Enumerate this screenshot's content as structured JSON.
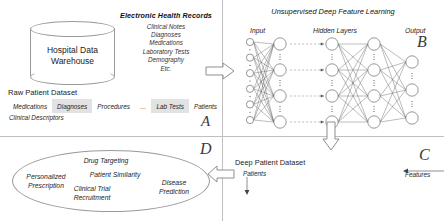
{
  "quadrants": {
    "a": "A",
    "b": "B",
    "c": "C",
    "d": "D"
  },
  "warehouse": {
    "label_line1": "Hospital Data",
    "label_line2": "Warehouse"
  },
  "ehr": {
    "title": "Electronic Health Records",
    "items": [
      "Clinical Notes",
      "Diagnoses",
      "Medications",
      "Laboratory Tests",
      "Demography",
      "Etc."
    ]
  },
  "raw_dataset": {
    "title": "Raw Patient Dataset",
    "columns": [
      {
        "label": "Medications",
        "shaded": false
      },
      {
        "label": "Diagnoses",
        "shaded": true
      },
      {
        "label": "Procedures",
        "shaded": false
      },
      {
        "label": "…",
        "shaded": false
      },
      {
        "label": "Lab Tests",
        "shaded": true
      },
      {
        "label": "Patients",
        "shaded": false
      }
    ],
    "descriptor_label": "Clinical Descriptors"
  },
  "network": {
    "title": "Unsupervised Deep Feature Learning",
    "input_label": "Input",
    "hidden_label": "Hidden Layers",
    "output_label": "Output"
  },
  "deep_dataset": {
    "title": "Deep Patient Dataset",
    "rows_axis_label": "Patients",
    "cols_axis_label": "Features"
  },
  "applications": {
    "items": [
      "Drug Targeting",
      "Patient Similarity",
      "Personalized Prescription",
      "Clinical Trial Recruitment",
      "Disease Prediction"
    ]
  },
  "colors": {
    "stroke": "#9a9a9a",
    "divider": "#bfbfbf",
    "shade": "#e2e2e2",
    "text": "#1a1a1a"
  }
}
